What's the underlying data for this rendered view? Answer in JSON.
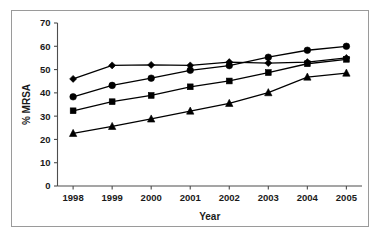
{
  "chart_data": {
    "type": "line",
    "title": "",
    "xlabel": "Year",
    "ylabel": "% MRSA",
    "categories": [
      "1998",
      "1999",
      "2000",
      "2001",
      "2002",
      "2003",
      "2004",
      "2005"
    ],
    "x": [
      1998,
      1999,
      2000,
      2001,
      2002,
      2003,
      2004,
      2005
    ],
    "xlim": [
      1997.6,
      2005.4
    ],
    "ylim": [
      0,
      70
    ],
    "yticks": [
      0,
      10,
      20,
      30,
      40,
      50,
      60,
      70
    ],
    "ytick_labels": [
      "0",
      "10",
      "20",
      "30",
      "40",
      "50",
      "60",
      "70"
    ],
    "grid": false,
    "legend": "none",
    "series": [
      {
        "name": "series-diamond",
        "marker": "diamond",
        "color": "#000000",
        "values": [
          46.0,
          51.8,
          52.0,
          51.8,
          53.2,
          52.8,
          53.2,
          55.0
        ]
      },
      {
        "name": "series-circle",
        "marker": "circle",
        "color": "#000000",
        "values": [
          38.3,
          43.2,
          46.3,
          49.7,
          51.7,
          55.3,
          58.3,
          60.0
        ]
      },
      {
        "name": "series-square",
        "marker": "square",
        "color": "#000000",
        "values": [
          32.3,
          36.2,
          38.9,
          42.6,
          45.1,
          48.7,
          52.5,
          54.4
        ]
      },
      {
        "name": "series-triangle",
        "marker": "triangle",
        "color": "#000000",
        "values": [
          22.6,
          25.6,
          28.8,
          32.2,
          35.5,
          40.1,
          46.8,
          48.5
        ]
      }
    ]
  },
  "axes": {
    "y_axis_title": "% MRSA",
    "x_axis_title": "Year"
  }
}
